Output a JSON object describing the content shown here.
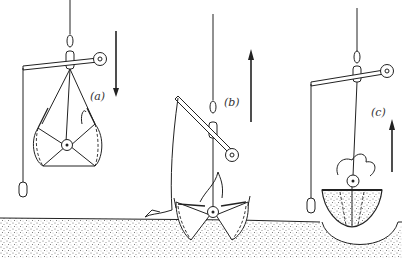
{
  "diagram": {
    "type": "grab-sampler operation sequence",
    "panels": [
      {
        "id": "a",
        "label": "(a)",
        "motion": "down",
        "state": "descending, jaws open"
      },
      {
        "id": "b",
        "label": "(b)",
        "motion": "up",
        "state": "jaws closing on bottom"
      },
      {
        "id": "c",
        "label": "(c)",
        "motion": "up",
        "state": "jaws closed with sample, leaving crater"
      }
    ],
    "colors": {
      "ink": "#222222",
      "sediment": "#9a9a9a",
      "background": "#ffffff"
    }
  }
}
